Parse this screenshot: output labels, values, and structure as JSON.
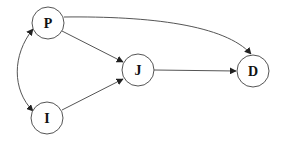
{
  "diagram": {
    "type": "directed-graph",
    "nodes": [
      {
        "id": "P",
        "label": "P",
        "cx": 48,
        "cy": 23,
        "r": 16
      },
      {
        "id": "J",
        "label": "J",
        "cx": 138,
        "cy": 70,
        "r": 16
      },
      {
        "id": "I",
        "label": "I",
        "cx": 47,
        "cy": 118,
        "r": 16
      },
      {
        "id": "D",
        "label": "D",
        "cx": 253,
        "cy": 71,
        "r": 16
      }
    ],
    "edges": [
      {
        "from": "P",
        "to": "J",
        "directed": true
      },
      {
        "from": "I",
        "to": "J",
        "directed": true
      },
      {
        "from": "J",
        "to": "D",
        "directed": true
      },
      {
        "from": "P",
        "to": "D",
        "directed": true,
        "curved": true
      },
      {
        "from": "P",
        "to": "I",
        "directed": true,
        "bidirectional": true,
        "curved": true
      }
    ],
    "colors": {
      "stroke": "#555555",
      "text": "#111111",
      "background": "#ffffff"
    }
  }
}
